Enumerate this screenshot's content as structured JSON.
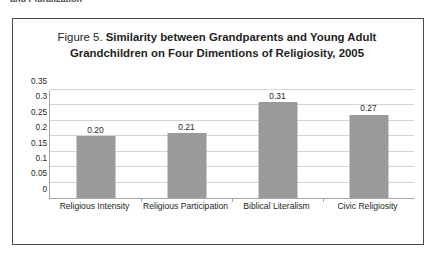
{
  "page": {
    "clipped_header_remnant": "and Pluralization"
  },
  "figure": {
    "number_label": "Figure 5.",
    "title_rest": " Similarity between Grandparents and Young Adult Grandchildren on Four Dimentions of Religiosity, 2005"
  },
  "colors": {
    "bar_fill": "#9a9a9a",
    "gridline": "#d4d4d4",
    "axis": "#a6a6a6",
    "frame": "#4b4b4b",
    "text": "#231f20"
  },
  "chart_data": {
    "type": "bar",
    "title": "Figure 5. Similarity between Grandparents and Young Adult Grandchildren on Four Dimentions of Religiosity, 2005",
    "xlabel": "",
    "ylabel": "",
    "categories": [
      "Religious Intensity",
      "Religious Participation",
      "Biblical Literalism",
      "Civic Religiosity"
    ],
    "values": [
      0.2,
      0.21,
      0.31,
      0.27
    ],
    "value_labels": [
      "0.20",
      "0.21",
      "0.31",
      "0.27"
    ],
    "ylim": [
      0,
      0.35
    ],
    "yticks": [
      0,
      0.05,
      0.1,
      0.15,
      0.2,
      0.25,
      0.3,
      0.35
    ],
    "ytick_labels": [
      "0",
      "0.05",
      "0.1",
      "0.15",
      "0.2",
      "0.25",
      "0.3",
      "0.35"
    ],
    "grid": true,
    "legend": false
  }
}
